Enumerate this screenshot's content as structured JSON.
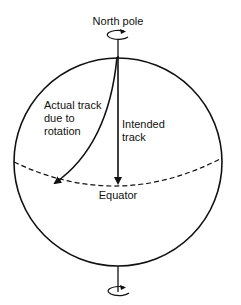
{
  "diagram": {
    "labels": {
      "north_pole": "North pole",
      "actual_track_line1": "Actual track",
      "actual_track_line2": "due to",
      "actual_track_line3": "rotation",
      "intended_track_line1": "Intended",
      "intended_track_line2": "track",
      "equator": "Equator"
    },
    "elements": {
      "globe": "circle",
      "axis": "vertical rotation axis",
      "north_rotation_icon": "counter-clockwise rotation arrow",
      "south_rotation_icon": "rotation arrow",
      "intended_track": "straight arrow from north pole to equator",
      "actual_track": "curved arrow deflected to the west",
      "equator_line": "dashed"
    },
    "colors": {
      "stroke": "#111111",
      "background": "#ffffff"
    }
  }
}
